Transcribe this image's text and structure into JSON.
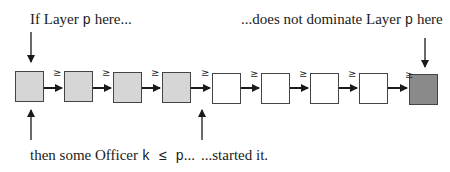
{
  "diagram": {
    "top_left_label": {
      "prefix": "If Layer ",
      "var": "p",
      "suffix": " here..."
    },
    "top_right_label": {
      "prefix": "...does not dominate Layer ",
      "var": "p",
      "suffix": " here"
    },
    "bottom_left_label": {
      "prefix": "then some Officer ",
      "var": "k ≤ p",
      "suffix": "..."
    },
    "bottom_right_label": "...started it.",
    "relation_symbol": "≥",
    "boxes": [
      {
        "fill": "shaded",
        "x": 15
      },
      {
        "fill": "shaded",
        "x": 64
      },
      {
        "fill": "shaded",
        "x": 113
      },
      {
        "fill": "shaded",
        "x": 162
      },
      {
        "fill": "empty",
        "x": 212
      },
      {
        "fill": "empty",
        "x": 261
      },
      {
        "fill": "empty",
        "x": 310
      },
      {
        "fill": "empty",
        "x": 359
      },
      {
        "fill": "dark",
        "x": 409
      }
    ],
    "colors": {
      "shaded": "#d6d6d6",
      "empty": "#ffffff",
      "dark": "#8a8a8a",
      "stroke": "#1a1a1a"
    }
  }
}
